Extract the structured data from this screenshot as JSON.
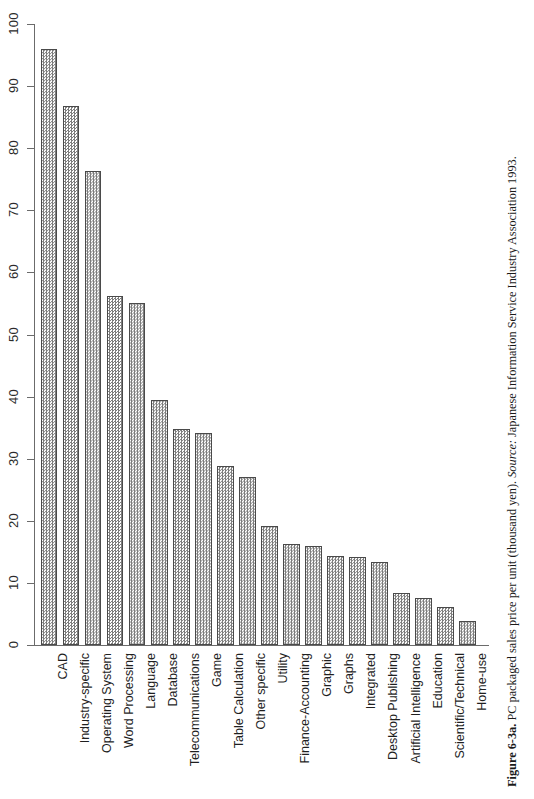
{
  "figure": {
    "caption_label": "Figure 6-3a.",
    "caption_main": "PC packaged sales price per unit (thousand yen).",
    "caption_source_label": "Source:",
    "caption_source_text": "Japanese Information Service Industry Association 1993."
  },
  "chart_data": {
    "type": "bar",
    "title": "PC packaged sales price per unit (thousand yen)",
    "xlabel": "",
    "ylabel": "",
    "ylim": [
      0,
      100
    ],
    "yticks": [
      0,
      10,
      20,
      30,
      40,
      50,
      60,
      70,
      80,
      90,
      100
    ],
    "ytick_labels": [
      "0",
      "10",
      "20",
      "30",
      "40",
      "50",
      "60",
      "70",
      "80",
      "90",
      "100"
    ],
    "grid": false,
    "legend": null,
    "bar_color": "#7d7d7d",
    "bar_edge_color": "#4a4a4a",
    "axis_color": "#6b6b6b",
    "categories": [
      "CAD",
      "Industry-specific",
      "Operating System",
      "Word Processing",
      "Language",
      "Database",
      "Telecommunications",
      "Game",
      "Table Calculation",
      "Other specific",
      "Utility",
      "Finance-Accounting",
      "Graphic",
      "Graphs",
      "Integrated",
      "Desktop Publishing",
      "Artificial Intelligence",
      "Education",
      "Scientific/Technical",
      "Home-use"
    ],
    "values": [
      96.0,
      86.8,
      76.4,
      56.2,
      55.0,
      39.5,
      34.8,
      34.2,
      28.8,
      27.0,
      19.2,
      16.2,
      16.0,
      14.3,
      14.2,
      13.3,
      8.4,
      7.5,
      6.1,
      3.8
    ]
  }
}
